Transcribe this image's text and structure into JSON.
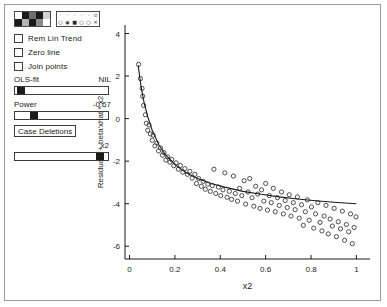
{
  "window": {
    "title": "Added variable plot"
  },
  "panel": {
    "color_palette": {
      "name": "color-palette",
      "swatches": [
        "#ffffff",
        "#1a1a1a",
        "#6e6e6e",
        "#1a1a1a",
        "#d0d0d0",
        "#1a1a1a",
        "#b5b5b5",
        "#1a1a1a",
        "#8a8a8a",
        "#ffffff"
      ]
    },
    "symbol_palette": {
      "name": "symbol-palette",
      "symbols": [
        "·",
        "·",
        "·",
        "·",
        "·",
        "⊙",
        "○",
        "◉",
        "■",
        "○",
        "○",
        "✕"
      ]
    },
    "checkboxes": [
      {
        "label": "Rem Lin Trend",
        "checked": false
      },
      {
        "label": "Zero line",
        "checked": false
      },
      {
        "label": "Join points",
        "checked": false
      }
    ],
    "ols_fit": {
      "label": "OLS-fit",
      "value": "NIL",
      "slider_pct": 2
    },
    "power": {
      "label": "Power",
      "value": "-0.67",
      "slider_pct": 18
    },
    "case_deletions_label": "Case Deletions",
    "x2_slider": {
      "label": "x2",
      "slider_pct": 95
    }
  },
  "chart_data": {
    "type": "scatter",
    "title": "",
    "xlabel": "x2",
    "ylabel": "Residuals + beta'xhat * x2",
    "xlim": [
      -0.02,
      1.06
    ],
    "ylim": [
      -6.6,
      4.4
    ],
    "xticks": [
      0,
      0.2,
      0.4,
      0.6,
      0.8,
      1
    ],
    "xticklabels": [
      "0",
      "0.2",
      "0.4",
      "0.6",
      "0.8",
      "1"
    ],
    "yticks": [
      4,
      2,
      0,
      -2,
      -4,
      -6
    ],
    "yticklabels": [
      "4",
      "2",
      "0",
      "-2",
      "-4",
      "-6"
    ],
    "grid": false,
    "legend": null,
    "marker": "open-circle",
    "points": [
      [
        0.04,
        2.55
      ],
      [
        0.048,
        1.88
      ],
      [
        0.055,
        1.42
      ],
      [
        0.058,
        1.05
      ],
      [
        0.062,
        0.62
      ],
      [
        0.07,
        0.18
      ],
      [
        0.074,
        -0.22
      ],
      [
        0.08,
        -0.55
      ],
      [
        0.086,
        -0.3
      ],
      [
        0.092,
        -0.72
      ],
      [
        0.1,
        -1.02
      ],
      [
        0.104,
        -0.78
      ],
      [
        0.112,
        -1.28
      ],
      [
        0.12,
        -1.15
      ],
      [
        0.128,
        -1.52
      ],
      [
        0.136,
        -1.38
      ],
      [
        0.145,
        -1.72
      ],
      [
        0.152,
        -1.6
      ],
      [
        0.16,
        -1.95
      ],
      [
        0.168,
        -1.8
      ],
      [
        0.178,
        -2.05
      ],
      [
        0.186,
        -1.92
      ],
      [
        0.195,
        -2.22
      ],
      [
        0.205,
        -2.08
      ],
      [
        0.215,
        -2.38
      ],
      [
        0.224,
        -2.2
      ],
      [
        0.235,
        -2.52
      ],
      [
        0.244,
        -2.35
      ],
      [
        0.255,
        -2.62
      ],
      [
        0.266,
        -2.48
      ],
      [
        0.276,
        -2.8
      ],
      [
        0.288,
        -2.62
      ],
      [
        0.295,
        -3.05
      ],
      [
        0.305,
        -2.82
      ],
      [
        0.316,
        -3.18
      ],
      [
        0.325,
        -2.95
      ],
      [
        0.334,
        -3.32
      ],
      [
        0.345,
        -3.08
      ],
      [
        0.356,
        -3.42
      ],
      [
        0.365,
        -3.15
      ],
      [
        0.372,
        -2.38
      ],
      [
        0.38,
        -3.52
      ],
      [
        0.392,
        -3.22
      ],
      [
        0.402,
        -3.62
      ],
      [
        0.412,
        -3.35
      ],
      [
        0.42,
        -2.55
      ],
      [
        0.43,
        -3.7
      ],
      [
        0.44,
        -3.42
      ],
      [
        0.45,
        -3.8
      ],
      [
        0.458,
        -2.7
      ],
      [
        0.466,
        -3.52
      ],
      [
        0.476,
        -3.88
      ],
      [
        0.485,
        -3.28
      ],
      [
        0.495,
        -3.62
      ],
      [
        0.505,
        -2.92
      ],
      [
        0.512,
        -4.02
      ],
      [
        0.522,
        -3.45
      ],
      [
        0.53,
        -2.82
      ],
      [
        0.54,
        -3.72
      ],
      [
        0.548,
        -4.12
      ],
      [
        0.556,
        -3.18
      ],
      [
        0.565,
        -3.55
      ],
      [
        0.575,
        -4.22
      ],
      [
        0.582,
        -3.35
      ],
      [
        0.592,
        -3.88
      ],
      [
        0.6,
        -3.05
      ],
      [
        0.608,
        -4.3
      ],
      [
        0.616,
        -3.62
      ],
      [
        0.625,
        -3.95
      ],
      [
        0.634,
        -3.28
      ],
      [
        0.642,
        -4.38
      ],
      [
        0.652,
        -3.72
      ],
      [
        0.66,
        -4.08
      ],
      [
        0.67,
        -3.45
      ],
      [
        0.678,
        -4.48
      ],
      [
        0.686,
        -3.85
      ],
      [
        0.695,
        -4.18
      ],
      [
        0.704,
        -3.58
      ],
      [
        0.712,
        -4.58
      ],
      [
        0.722,
        -3.95
      ],
      [
        0.73,
        -4.28
      ],
      [
        0.74,
        -3.68
      ],
      [
        0.748,
        -4.68
      ],
      [
        0.758,
        -4.05
      ],
      [
        0.766,
        -5.02
      ],
      [
        0.775,
        -4.38
      ],
      [
        0.784,
        -3.82
      ],
      [
        0.792,
        -4.78
      ],
      [
        0.802,
        -4.15
      ],
      [
        0.812,
        -5.15
      ],
      [
        0.82,
        -4.48
      ],
      [
        0.83,
        -3.95
      ],
      [
        0.84,
        -4.88
      ],
      [
        0.848,
        -5.28
      ],
      [
        0.858,
        -4.58
      ],
      [
        0.866,
        -4.08
      ],
      [
        0.876,
        -5.42
      ],
      [
        0.884,
        -4.72
      ],
      [
        0.894,
        -5.05
      ],
      [
        0.902,
        -4.22
      ],
      [
        0.912,
        -5.55
      ],
      [
        0.92,
        -4.85
      ],
      [
        0.93,
        -5.18
      ],
      [
        0.938,
        -4.35
      ],
      [
        0.948,
        -5.72
      ],
      [
        0.956,
        -4.98
      ],
      [
        0.966,
        -5.32
      ],
      [
        0.974,
        -4.48
      ],
      [
        0.982,
        -5.88
      ],
      [
        0.99,
        -5.12
      ],
      [
        0.998,
        -4.62
      ]
    ],
    "fit_curve": {
      "kind": "power",
      "note": "smooth monotone decreasing fit",
      "x": [
        0.038,
        0.05,
        0.065,
        0.08,
        0.1,
        0.13,
        0.16,
        0.2,
        0.25,
        0.3,
        0.36,
        0.42,
        0.5,
        0.58,
        0.66,
        0.74,
        0.82,
        0.9,
        1.0
      ],
      "y": [
        2.5,
        1.55,
        0.7,
        0.1,
        -0.55,
        -1.25,
        -1.72,
        -2.15,
        -2.55,
        -2.82,
        -3.05,
        -3.22,
        -3.42,
        -3.56,
        -3.68,
        -3.78,
        -3.86,
        -3.93,
        -4.0
      ]
    }
  }
}
